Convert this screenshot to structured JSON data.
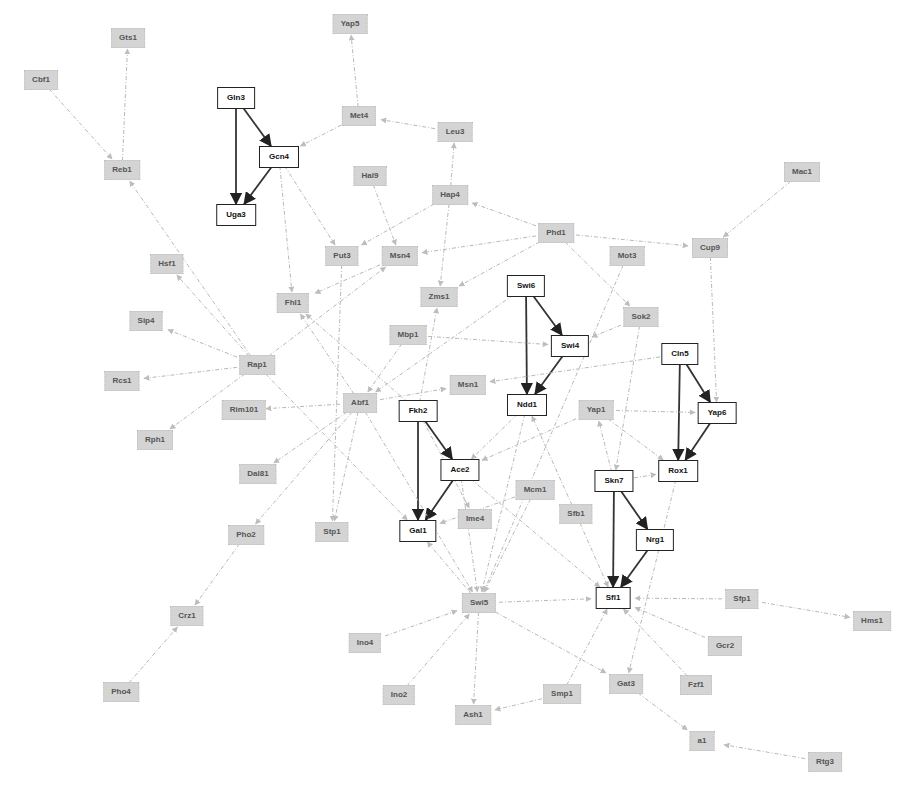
{
  "diagram": {
    "type": "gene-regulatory-network",
    "colors": {
      "core_border": "#222222",
      "core_fill": "#ffffff",
      "peripheral_fill": "#d4d4d4",
      "core_edge": "#333333",
      "peripheral_edge": "#b8b8b8"
    },
    "nodes": [
      {
        "id": "Cbf1",
        "label": "Cbf1",
        "x": 41,
        "y": 80,
        "core": false
      },
      {
        "id": "Gts1",
        "label": "Gts1",
        "x": 128,
        "y": 38,
        "core": false
      },
      {
        "id": "Reb1",
        "label": "Reb1",
        "x": 122,
        "y": 170,
        "core": false
      },
      {
        "id": "Gln3",
        "label": "Gln3",
        "x": 236,
        "y": 98,
        "core": true
      },
      {
        "id": "Gcn4",
        "label": "Gcn4",
        "x": 279,
        "y": 157,
        "core": true
      },
      {
        "id": "Uga3",
        "label": "Uga3",
        "x": 236,
        "y": 215,
        "core": true
      },
      {
        "id": "Yap5",
        "label": "Yap5",
        "x": 350,
        "y": 24,
        "core": false
      },
      {
        "id": "Met4",
        "label": "Met4",
        "x": 359,
        "y": 116,
        "core": false
      },
      {
        "id": "Leu3",
        "label": "Leu3",
        "x": 455,
        "y": 132,
        "core": false
      },
      {
        "id": "Hal9",
        "label": "Hal9",
        "x": 370,
        "y": 176,
        "core": false
      },
      {
        "id": "Hap4",
        "label": "Hap4",
        "x": 450,
        "y": 195,
        "core": false
      },
      {
        "id": "Phd1",
        "label": "Phd1",
        "x": 556,
        "y": 233,
        "core": false
      },
      {
        "id": "Mac1",
        "label": "Mac1",
        "x": 802,
        "y": 172,
        "core": false
      },
      {
        "id": "Cup9",
        "label": "Cup9",
        "x": 710,
        "y": 248,
        "core": false
      },
      {
        "id": "Mot3",
        "label": "Mot3",
        "x": 627,
        "y": 256,
        "core": false
      },
      {
        "id": "Hsf1",
        "label": "Hsf1",
        "x": 167,
        "y": 264,
        "core": false
      },
      {
        "id": "Put3",
        "label": "Put3",
        "x": 342,
        "y": 256,
        "core": false
      },
      {
        "id": "Msn4",
        "label": "Msn4",
        "x": 400,
        "y": 256,
        "core": false
      },
      {
        "id": "Fhl1",
        "label": "Fhl1",
        "x": 293,
        "y": 303,
        "core": false
      },
      {
        "id": "Zms1",
        "label": "Zms1",
        "x": 439,
        "y": 297,
        "core": false
      },
      {
        "id": "Swi6",
        "label": "Swi6",
        "x": 526,
        "y": 286,
        "core": true
      },
      {
        "id": "Sok2",
        "label": "Sok2",
        "x": 641,
        "y": 317,
        "core": false
      },
      {
        "id": "Sip4",
        "label": "Sip4",
        "x": 146,
        "y": 321,
        "core": false
      },
      {
        "id": "Mbp1",
        "label": "Mbp1",
        "x": 408,
        "y": 335,
        "core": false
      },
      {
        "id": "Swi4",
        "label": "Swi4",
        "x": 570,
        "y": 346,
        "core": true
      },
      {
        "id": "Cln5",
        "label": "Cln5",
        "x": 680,
        "y": 354,
        "core": true
      },
      {
        "id": "Rap1",
        "label": "Rap1",
        "x": 257,
        "y": 365,
        "core": false
      },
      {
        "id": "Rcs1",
        "label": "Rcs1",
        "x": 122,
        "y": 381,
        "core": false
      },
      {
        "id": "Msn1",
        "label": "Msn1",
        "x": 468,
        "y": 385,
        "core": false
      },
      {
        "id": "Ndd1",
        "label": "Ndd1",
        "x": 527,
        "y": 405,
        "core": true
      },
      {
        "id": "Yap1",
        "label": "Yap1",
        "x": 596,
        "y": 410,
        "core": false
      },
      {
        "id": "Yap6",
        "label": "Yap6",
        "x": 717,
        "y": 413,
        "core": true
      },
      {
        "id": "Rim101",
        "label": "Rim101",
        "x": 244,
        "y": 410,
        "core": false
      },
      {
        "id": "Abf1",
        "label": "Abf1",
        "x": 360,
        "y": 403,
        "core": false
      },
      {
        "id": "Fkh2",
        "label": "Fkh2",
        "x": 418,
        "y": 411,
        "core": true
      },
      {
        "id": "Rph1",
        "label": "Rph1",
        "x": 155,
        "y": 440,
        "core": false
      },
      {
        "id": "Dal81",
        "label": "Dal81",
        "x": 258,
        "y": 474,
        "core": false
      },
      {
        "id": "Ace2",
        "label": "Ace2",
        "x": 460,
        "y": 470,
        "core": true
      },
      {
        "id": "Rox1",
        "label": "Rox1",
        "x": 678,
        "y": 471,
        "core": true
      },
      {
        "id": "Mcm1",
        "label": "Mcm1",
        "x": 535,
        "y": 490,
        "core": false
      },
      {
        "id": "Skn7",
        "label": "Skn7",
        "x": 614,
        "y": 481,
        "core": true
      },
      {
        "id": "Sfb1",
        "label": "Sfb1",
        "x": 576,
        "y": 514,
        "core": false
      },
      {
        "id": "Ime4",
        "label": "Ime4",
        "x": 475,
        "y": 519,
        "core": false
      },
      {
        "id": "Pho2",
        "label": "Pho2",
        "x": 246,
        "y": 535,
        "core": false
      },
      {
        "id": "Stp1",
        "label": "Stp1",
        "x": 332,
        "y": 532,
        "core": false
      },
      {
        "id": "Gal1",
        "label": "Gal1",
        "x": 418,
        "y": 531,
        "core": true
      },
      {
        "id": "Nrg1",
        "label": "Nrg1",
        "x": 655,
        "y": 540,
        "core": true
      },
      {
        "id": "Crz1",
        "label": "Crz1",
        "x": 187,
        "y": 616,
        "core": false
      },
      {
        "id": "Swi5",
        "label": "Swi5",
        "x": 479,
        "y": 603,
        "core": false
      },
      {
        "id": "Sfl1",
        "label": "Sfl1",
        "x": 613,
        "y": 598,
        "core": true
      },
      {
        "id": "Sfp1",
        "label": "Sfp1",
        "x": 742,
        "y": 599,
        "core": false
      },
      {
        "id": "Hms1",
        "label": "Hms1",
        "x": 872,
        "y": 621,
        "core": false
      },
      {
        "id": "Ino4",
        "label": "Ino4",
        "x": 365,
        "y": 643,
        "core": false
      },
      {
        "id": "Gcr2",
        "label": "Gcr2",
        "x": 725,
        "y": 646,
        "core": false
      },
      {
        "id": "Pho4",
        "label": "Pho4",
        "x": 121,
        "y": 692,
        "core": false
      },
      {
        "id": "Ino2",
        "label": "Ino2",
        "x": 399,
        "y": 695,
        "core": false
      },
      {
        "id": "Smp1",
        "label": "Smp1",
        "x": 562,
        "y": 694,
        "core": false
      },
      {
        "id": "Gat3",
        "label": "Gat3",
        "x": 626,
        "y": 684,
        "core": false
      },
      {
        "id": "Fzf1",
        "label": "Fzf1",
        "x": 696,
        "y": 685,
        "core": false
      },
      {
        "id": "Ash1",
        "label": "Ash1",
        "x": 473,
        "y": 715,
        "core": false
      },
      {
        "id": "a1",
        "label": "a1",
        "x": 702,
        "y": 741,
        "core": false
      },
      {
        "id": "Rtg3",
        "label": "Rtg3",
        "x": 825,
        "y": 762,
        "core": false
      }
    ],
    "edges": [
      {
        "from": "Gln3",
        "to": "Gcn4",
        "core": true
      },
      {
        "from": "Gln3",
        "to": "Uga3",
        "core": true
      },
      {
        "from": "Gcn4",
        "to": "Uga3",
        "core": true
      },
      {
        "from": "Swi6",
        "to": "Swi4",
        "core": true
      },
      {
        "from": "Swi6",
        "to": "Ndd1",
        "core": true
      },
      {
        "from": "Swi4",
        "to": "Ndd1",
        "core": true
      },
      {
        "from": "Cln5",
        "to": "Yap6",
        "core": true
      },
      {
        "from": "Cln5",
        "to": "Rox1",
        "core": true
      },
      {
        "from": "Yap6",
        "to": "Rox1",
        "core": true
      },
      {
        "from": "Fkh2",
        "to": "Ace2",
        "core": true
      },
      {
        "from": "Fkh2",
        "to": "Gal1",
        "core": true
      },
      {
        "from": "Ace2",
        "to": "Gal1",
        "core": true
      },
      {
        "from": "Skn7",
        "to": "Nrg1",
        "core": true
      },
      {
        "from": "Skn7",
        "to": "Sfl1",
        "core": true
      },
      {
        "from": "Nrg1",
        "to": "Sfl1",
        "core": true
      },
      {
        "from": "Cbf1",
        "to": "Reb1",
        "core": false
      },
      {
        "from": "Reb1",
        "to": "Gts1",
        "core": false
      },
      {
        "from": "Rap1",
        "to": "Reb1",
        "core": false
      },
      {
        "from": "Met4",
        "to": "Yap5",
        "core": false
      },
      {
        "from": "Leu3",
        "to": "Met4",
        "core": false
      },
      {
        "from": "Hap4",
        "to": "Leu3",
        "core": false
      },
      {
        "from": "Met4",
        "to": "Gcn4",
        "core": false
      },
      {
        "from": "Gcn4",
        "to": "Put3",
        "core": false
      },
      {
        "from": "Gcn4",
        "to": "Fhl1",
        "core": false
      },
      {
        "from": "Hal9",
        "to": "Msn4",
        "core": false
      },
      {
        "from": "Hap4",
        "to": "Put3",
        "core": false
      },
      {
        "from": "Hap4",
        "to": "Zms1",
        "core": false
      },
      {
        "from": "Phd1",
        "to": "Hap4",
        "core": false
      },
      {
        "from": "Phd1",
        "to": "Msn4",
        "core": false
      },
      {
        "from": "Phd1",
        "to": "Cup9",
        "core": false
      },
      {
        "from": "Phd1",
        "to": "Sok2",
        "core": false
      },
      {
        "from": "Phd1",
        "to": "Zms1",
        "core": false
      },
      {
        "from": "Mac1",
        "to": "Cup9",
        "core": false
      },
      {
        "from": "Cup9",
        "to": "Yap6",
        "core": false
      },
      {
        "from": "Msn4",
        "to": "Fhl1",
        "core": false
      },
      {
        "from": "Put3",
        "to": "Stp1",
        "core": false
      },
      {
        "from": "Rap1",
        "to": "Hsf1",
        "core": false
      },
      {
        "from": "Rap1",
        "to": "Sip4",
        "core": false
      },
      {
        "from": "Rap1",
        "to": "Rcs1",
        "core": false
      },
      {
        "from": "Rap1",
        "to": "Rph1",
        "core": false
      },
      {
        "from": "Rap1",
        "to": "Msn4",
        "core": false
      },
      {
        "from": "Rap1",
        "to": "Gal1",
        "core": false
      },
      {
        "from": "Abf1",
        "to": "Rim101",
        "core": false
      },
      {
        "from": "Abf1",
        "to": "Fhl1",
        "core": false
      },
      {
        "from": "Abf1",
        "to": "Msn1",
        "core": false
      },
      {
        "from": "Abf1",
        "to": "Dal81",
        "core": false
      },
      {
        "from": "Abf1",
        "to": "Pho2",
        "core": false
      },
      {
        "from": "Abf1",
        "to": "Stp1",
        "core": false
      },
      {
        "from": "Abf1",
        "to": "Swi5",
        "core": false
      },
      {
        "from": "Mbp1",
        "to": "Abf1",
        "core": false
      },
      {
        "from": "Mbp1",
        "to": "Swi4",
        "core": false
      },
      {
        "from": "Swi6",
        "to": "Abf1",
        "core": false
      },
      {
        "from": "Cln5",
        "to": "Msn1",
        "core": false
      },
      {
        "from": "Sok2",
        "to": "Swi4",
        "core": false
      },
      {
        "from": "Sok2",
        "to": "Skn7",
        "core": false
      },
      {
        "from": "Mot3",
        "to": "Swi5",
        "core": false
      },
      {
        "from": "Fkh2",
        "to": "Zms1",
        "core": false
      },
      {
        "from": "Fkh2",
        "to": "Fhl1",
        "core": false
      },
      {
        "from": "Fkh2",
        "to": "Ime4",
        "core": false
      },
      {
        "from": "Ndd1",
        "to": "Ace2",
        "core": false
      },
      {
        "from": "Ndd1",
        "to": "Swi5",
        "core": false
      },
      {
        "from": "Yap1",
        "to": "Yap6",
        "core": false
      },
      {
        "from": "Yap1",
        "to": "Ace2",
        "core": false
      },
      {
        "from": "Yap1",
        "to": "Rox1",
        "core": false
      },
      {
        "from": "Skn7",
        "to": "Yap1",
        "core": false
      },
      {
        "from": "Skn7",
        "to": "Rox1",
        "core": false
      },
      {
        "from": "Ace2",
        "to": "Sfl1",
        "core": false
      },
      {
        "from": "Ace2",
        "to": "Swi5",
        "core": false
      },
      {
        "from": "Mcm1",
        "to": "Swi5",
        "core": false
      },
      {
        "from": "Mcm1",
        "to": "Gal1",
        "core": false
      },
      {
        "from": "Sfb1",
        "to": "Ndd1",
        "core": false
      },
      {
        "from": "Sfb1",
        "to": "Sfl1",
        "core": false
      },
      {
        "from": "Rox1",
        "to": "Gat3",
        "core": false
      },
      {
        "from": "Swi5",
        "to": "Sfl1",
        "core": false
      },
      {
        "from": "Swi5",
        "to": "Gal1",
        "core": false
      },
      {
        "from": "Swi5",
        "to": "Ash1",
        "core": false
      },
      {
        "from": "Swi5",
        "to": "Gat3",
        "core": false
      },
      {
        "from": "Ino4",
        "to": "Swi5",
        "core": false
      },
      {
        "from": "Ino2",
        "to": "Swi5",
        "core": false
      },
      {
        "from": "Smp1",
        "to": "Ash1",
        "core": false
      },
      {
        "from": "Smp1",
        "to": "Sfl1",
        "core": false
      },
      {
        "from": "Sfp1",
        "to": "Sfl1",
        "core": false
      },
      {
        "from": "Sfp1",
        "to": "Hms1",
        "core": false
      },
      {
        "from": "Gcr2",
        "to": "Sfl1",
        "core": false
      },
      {
        "from": "Fzf1",
        "to": "Sfl1",
        "core": false
      },
      {
        "from": "Gat3",
        "to": "a1",
        "core": false
      },
      {
        "from": "Rtg3",
        "to": "a1",
        "core": false
      },
      {
        "from": "Pho2",
        "to": "Crz1",
        "core": false
      },
      {
        "from": "Pho4",
        "to": "Crz1",
        "core": false
      }
    ]
  }
}
